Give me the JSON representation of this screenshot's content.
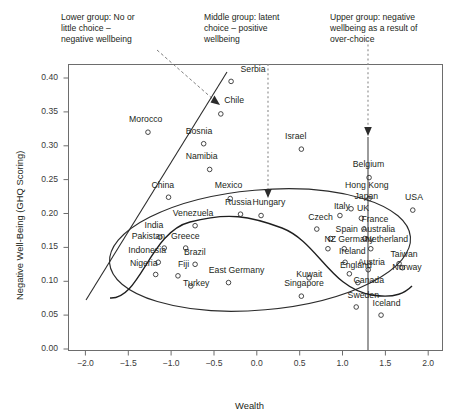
{
  "chart_data": {
    "type": "scatter",
    "title": "",
    "xlabel": "Wealth",
    "ylabel": "Negative Well-Being (GHQ Scoring)",
    "xlim": [
      -2.2,
      2.2
    ],
    "ylim": [
      -0.015,
      0.425
    ],
    "xticks": [
      "-2.0",
      "-1.5",
      "-1.0",
      "-0.5",
      "0.0",
      "0.5",
      "1.0",
      "1.5",
      "2.0"
    ],
    "xtickvals": [
      -2.0,
      -1.5,
      -1.0,
      -0.5,
      0.0,
      0.5,
      1.0,
      1.5,
      2.0
    ],
    "yticks": [
      "0.00",
      "0.05",
      "0.10",
      "0.15",
      "0.20",
      "0.25",
      "0.30",
      "0.35",
      "0.40"
    ],
    "ytickvals": [
      0.0,
      0.05,
      0.1,
      0.15,
      0.2,
      0.25,
      0.3,
      0.35,
      0.4
    ],
    "grid": false,
    "legend": "none",
    "marker": "open-circle",
    "points": [
      {
        "label": "Serbia",
        "x": -0.3,
        "y": 0.395,
        "lx": -0.19,
        "ly": 0.412,
        "anchor": "start"
      },
      {
        "label": "Chile",
        "x": -0.42,
        "y": 0.347,
        "lx": -0.38,
        "ly": 0.366,
        "anchor": "start"
      },
      {
        "label": "Morocco",
        "x": -1.27,
        "y": 0.32,
        "lx": -1.49,
        "ly": 0.338,
        "anchor": "start"
      },
      {
        "label": "Bosnia",
        "x": -0.62,
        "y": 0.303,
        "lx": -0.83,
        "ly": 0.32,
        "anchor": "start"
      },
      {
        "label": "Israel",
        "x": 0.52,
        "y": 0.295,
        "lx": 0.33,
        "ly": 0.313,
        "anchor": "start"
      },
      {
        "label": "Namibia",
        "x": -0.55,
        "y": 0.265,
        "lx": -0.83,
        "ly": 0.283,
        "anchor": "start"
      },
      {
        "label": "Belgium",
        "x": 1.31,
        "y": 0.253,
        "lx": 1.12,
        "ly": 0.271,
        "anchor": "start"
      },
      {
        "label": "Hong Kong",
        "x": 1.31,
        "y": 0.222,
        "lx": 1.03,
        "ly": 0.24,
        "anchor": "start"
      },
      {
        "label": "China",
        "x": -1.03,
        "y": 0.224,
        "lx": -1.23,
        "ly": 0.241,
        "anchor": "start"
      },
      {
        "label": "Mexico",
        "x": -0.31,
        "y": 0.222,
        "lx": -0.49,
        "ly": 0.24,
        "anchor": "start"
      },
      {
        "label": "Japan",
        "x": 1.1,
        "y": 0.207,
        "lx": 1.14,
        "ly": 0.224,
        "anchor": "start"
      },
      {
        "label": "USA",
        "x": 1.82,
        "y": 0.205,
        "lx": 1.73,
        "ly": 0.223,
        "anchor": "start"
      },
      {
        "label": "Russia",
        "x": -0.19,
        "y": 0.199,
        "lx": -0.37,
        "ly": 0.216,
        "anchor": "start"
      },
      {
        "label": "Hungary",
        "x": 0.05,
        "y": 0.197,
        "lx": -0.05,
        "ly": 0.215,
        "anchor": "start"
      },
      {
        "label": "Italy",
        "x": 0.97,
        "y": 0.197,
        "lx": 0.9,
        "ly": 0.209,
        "anchor": "start"
      },
      {
        "label": "UK",
        "x": 1.22,
        "y": 0.193,
        "lx": 1.17,
        "ly": 0.206,
        "anchor": "start"
      },
      {
        "label": "Venezuela",
        "x": -0.72,
        "y": 0.182,
        "lx": -0.98,
        "ly": 0.199,
        "anchor": "start"
      },
      {
        "label": "Czech",
        "x": 0.7,
        "y": 0.177,
        "lx": 0.6,
        "ly": 0.194,
        "anchor": "start"
      },
      {
        "label": "France",
        "x": 1.25,
        "y": 0.177,
        "lx": 1.22,
        "ly": 0.19,
        "anchor": "start"
      },
      {
        "label": "India",
        "x": -1.13,
        "y": 0.165,
        "lx": -1.31,
        "ly": 0.182,
        "anchor": "start"
      },
      {
        "label": "Spain",
        "x": 0.86,
        "y": 0.163,
        "lx": 0.92,
        "ly": 0.176,
        "anchor": "start"
      },
      {
        "label": "Australia",
        "x": 1.26,
        "y": 0.163,
        "lx": 1.22,
        "ly": 0.176,
        "anchor": "start"
      },
      {
        "label": "Pakistan",
        "x": -1.08,
        "y": 0.149,
        "lx": -1.46,
        "ly": 0.166,
        "anchor": "start"
      },
      {
        "label": "Greece",
        "x": -0.83,
        "y": 0.149,
        "lx": -1.0,
        "ly": 0.166,
        "anchor": "start"
      },
      {
        "label": "NZ",
        "x": 0.83,
        "y": 0.148,
        "lx": 0.79,
        "ly": 0.161,
        "anchor": "start"
      },
      {
        "label": "Germany",
        "x": 1.02,
        "y": 0.148,
        "lx": 0.95,
        "ly": 0.161,
        "anchor": "start"
      },
      {
        "label": "Netherland",
        "x": 1.33,
        "y": 0.148,
        "lx": 1.27,
        "ly": 0.161,
        "anchor": "start"
      },
      {
        "label": "Indonesia",
        "x": -1.15,
        "y": 0.128,
        "lx": -1.5,
        "ly": 0.145,
        "anchor": "start"
      },
      {
        "label": "Brazil",
        "x": -0.72,
        "y": 0.125,
        "lx": -0.85,
        "ly": 0.142,
        "anchor": "start"
      },
      {
        "label": "Ireland",
        "x": 1.03,
        "y": 0.128,
        "lx": 0.96,
        "ly": 0.143,
        "anchor": "start"
      },
      {
        "label": "Taiwan",
        "x": 1.66,
        "y": 0.126,
        "lx": 1.56,
        "ly": 0.139,
        "anchor": "start"
      },
      {
        "label": "Nigeria",
        "x": -1.18,
        "y": 0.11,
        "lx": -1.48,
        "ly": 0.126,
        "anchor": "start"
      },
      {
        "label": "Fiji",
        "x": -0.92,
        "y": 0.108,
        "lx": -0.92,
        "ly": 0.124,
        "anchor": "start"
      },
      {
        "label": "England",
        "x": 1.08,
        "y": 0.111,
        "lx": 0.97,
        "ly": 0.122,
        "anchor": "start"
      },
      {
        "label": "Austria",
        "x": 1.3,
        "y": 0.117,
        "lx": 1.18,
        "ly": 0.127,
        "anchor": "start"
      },
      {
        "label": "Norway",
        "x": 1.7,
        "y": 0.12,
        "lx": 1.58,
        "ly": 0.119,
        "anchor": "start"
      },
      {
        "label": "East Germany",
        "x": -0.33,
        "y": 0.098,
        "lx": -0.56,
        "ly": 0.115,
        "anchor": "start"
      },
      {
        "label": "Kuwait",
        "x": 0.61,
        "y": 0.105,
        "lx": 0.46,
        "ly": 0.11,
        "anchor": "start"
      },
      {
        "label": "Turkey",
        "x": -0.77,
        "y": 0.093,
        "lx": -0.86,
        "ly": 0.096,
        "anchor": "start"
      },
      {
        "label": "Singapore",
        "x": 0.52,
        "y": 0.078,
        "lx": 0.32,
        "ly": 0.096,
        "anchor": "start"
      },
      {
        "label": "Canada",
        "x": 1.18,
        "y": 0.098,
        "lx": 1.13,
        "ly": 0.1,
        "anchor": "start"
      },
      {
        "label": "Sweden",
        "x": 1.16,
        "y": 0.062,
        "lx": 1.06,
        "ly": 0.079,
        "anchor": "start"
      },
      {
        "label": "Iceland",
        "x": 1.45,
        "y": 0.05,
        "lx": 1.35,
        "ly": 0.066,
        "anchor": "start"
      }
    ],
    "annotations": [
      {
        "name": "lower-group-note",
        "text": "Lower group: No or\nlittle choice –\nnegative wellbeing"
      },
      {
        "name": "middle-group-note",
        "text": "Middle group: latent\nchoice – positive\nwellbeing"
      },
      {
        "name": "upper-group-note",
        "text": "Upper group: negative\nwellbeing as a result of\nover-choice"
      }
    ],
    "reference_lines": [
      {
        "name": "middle-group-dashed-line",
        "style": "dashed",
        "x": 0.13
      },
      {
        "name": "upper-group-dashed-line",
        "style": "dashed",
        "x": 1.3
      },
      {
        "name": "upper-group-solid-line",
        "style": "solid",
        "x": 1.3
      },
      {
        "name": "lower-group-trend-line",
        "style": "solid"
      }
    ],
    "shapes": [
      {
        "name": "data-cloud-ellipse",
        "type": "ellipse"
      },
      {
        "name": "sigmoid-trend-curve",
        "type": "curve"
      }
    ]
  }
}
